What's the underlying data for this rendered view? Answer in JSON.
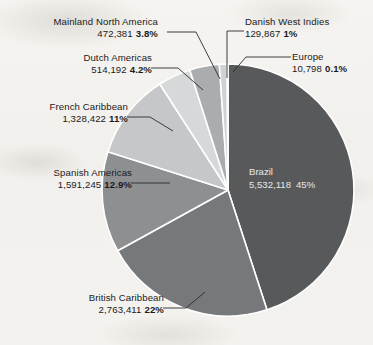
{
  "figure": {
    "background_color": "#f4f2ee",
    "text_color": "#1b1b1b",
    "inside_text_color": "#e8e8e6",
    "leader_color": "#2b2b2b",
    "separator_color": "#ffffff"
  },
  "chart_data": {
    "type": "pie",
    "title": "",
    "subtitle": "",
    "xlabel": "",
    "ylabel": "",
    "legend_position": "none",
    "grid": false,
    "total": 12342434,
    "start_angle_deg": 0,
    "direction": "clockwise",
    "categories": [
      "Brazil",
      "British Caribbean",
      "Spanish Americas",
      "French Caribbean",
      "Dutch Americas",
      "Mainland North America",
      "Danish West Indies",
      "Europe"
    ],
    "values": [
      5532118,
      2763411,
      1591245,
      1328422,
      514192,
      472381,
      129867,
      10798
    ],
    "percents": [
      45,
      22,
      12.9,
      11,
      4.2,
      3.8,
      1,
      0.1
    ],
    "colors": [
      "#58595b",
      "#77787b",
      "#8d8f91",
      "#c5c7c9",
      "#d6d8da",
      "#aaacae",
      "#cfd1d3",
      "#232323"
    ],
    "slices": [
      {
        "label": "Brazil",
        "value_text": "5,532,118",
        "percent_text": "45%",
        "value": 5532118,
        "percent": 45,
        "color": "#58595b",
        "label_placement": "inside"
      },
      {
        "label": "British Caribbean",
        "value_text": "2,763,411",
        "percent_text": "22%",
        "value": 2763411,
        "percent": 22,
        "color": "#77787b",
        "label_placement": "outside-bottom-left"
      },
      {
        "label": "Spanish Americas",
        "value_text": "1,591,245",
        "percent_text": "12.9%",
        "value": 1591245,
        "percent": 12.9,
        "color": "#8d8f91",
        "label_placement": "outside-left"
      },
      {
        "label": "French Caribbean",
        "value_text": "1,328,422",
        "percent_text": "11%",
        "value": 1328422,
        "percent": 11,
        "color": "#c5c7c9",
        "label_placement": "outside-upper-left"
      },
      {
        "label": "Dutch Americas",
        "value_text": "514,192",
        "percent_text": "4.2%",
        "value": 514192,
        "percent": 4.2,
        "color": "#d6d8da",
        "label_placement": "outside-upper-left"
      },
      {
        "label": "Mainland North America",
        "value_text": "472,381",
        "percent_text": "3.8%",
        "value": 472381,
        "percent": 3.8,
        "color": "#aaacae",
        "label_placement": "outside-top-left"
      },
      {
        "label": "Danish West Indies",
        "value_text": "129,867",
        "percent_text": "1%",
        "value": 129867,
        "percent": 1,
        "color": "#cfd1d3",
        "label_placement": "outside-top-right"
      },
      {
        "label": "Europe",
        "value_text": "10,798",
        "percent_text": "0.1%",
        "value": 10798,
        "percent": 0.1,
        "color": "#232323",
        "label_placement": "outside-right"
      }
    ],
    "geometry": {
      "center_x": 228,
      "center_y": 190,
      "radius": 126
    }
  }
}
